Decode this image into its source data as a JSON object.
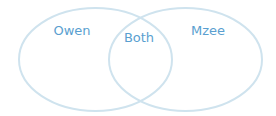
{
  "diagram": {
    "type": "venn",
    "sets": [
      {
        "label": "Owen"
      },
      {
        "label": "Mzee"
      }
    ],
    "intersection": {
      "label": "Both"
    },
    "colors": {
      "outline": "#cfe3ee",
      "text": "#5a9fd0",
      "background": "#ffffff"
    }
  }
}
